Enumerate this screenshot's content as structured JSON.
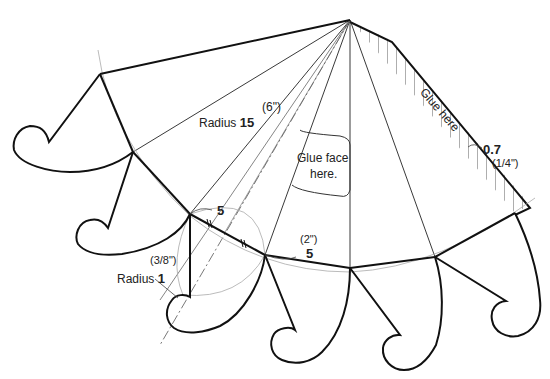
{
  "diagram": {
    "type": "pattern-template",
    "colors": {
      "line": "#111111",
      "guide": "#888888",
      "light_guide": "#b5b5b5",
      "background": "#ffffff"
    }
  },
  "labels": {
    "radius_large_inch": "(6\")",
    "radius_large_prefix": "Radius",
    "radius_large_value": "15",
    "glue_face": "Glue face",
    "glue_face_line2": "here.",
    "glue_here": "Glue here",
    "glue_width_value": "0.7",
    "glue_width_inch": "(1/4\")",
    "segment_top_value": "5",
    "segment_right_inch": "(2\")",
    "segment_right_value": "5",
    "radius_small_inch": "(3/8\")",
    "radius_small_prefix": "Radius",
    "radius_small_value": "1"
  }
}
